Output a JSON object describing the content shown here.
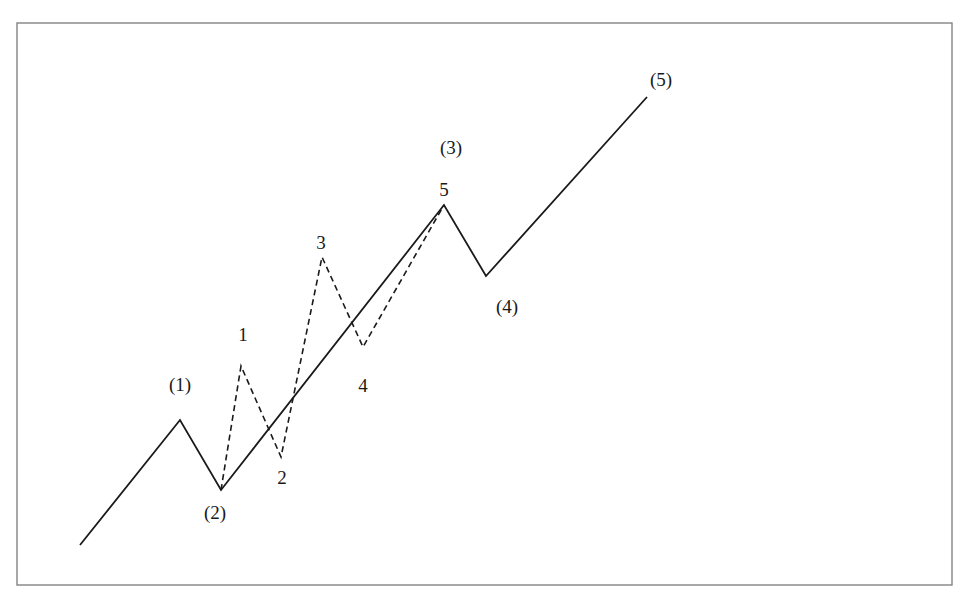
{
  "diagram": {
    "frame": {
      "x": 17,
      "y": 23,
      "width": 935,
      "height": 562,
      "color": "#7a7a7a"
    },
    "main_wave": {
      "style": "solid",
      "color": "#1a1a1a",
      "points": [
        [
          80,
          545
        ],
        [
          180,
          420
        ],
        [
          221,
          490
        ],
        [
          444,
          205
        ],
        [
          486,
          276
        ],
        [
          647,
          97
        ]
      ]
    },
    "sub_wave": {
      "style": "dashed",
      "color": "#1a1a1a",
      "points": [
        [
          221,
          490
        ],
        [
          241,
          366
        ],
        [
          281,
          457
        ],
        [
          322,
          257
        ],
        [
          363,
          347
        ],
        [
          444,
          205
        ]
      ]
    },
    "labels": {
      "main_1": "(1)",
      "main_2": "(2)",
      "main_3": "(3)",
      "main_4": "(4)",
      "main_5": "(5)",
      "sub_1": "1",
      "sub_2": "2",
      "sub_3": "3",
      "sub_4": "4",
      "sub_5": "5"
    }
  }
}
